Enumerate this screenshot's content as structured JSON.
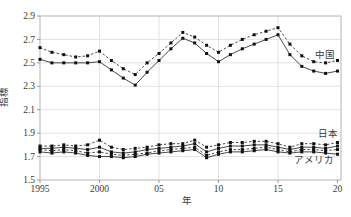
{
  "chart_data": {
    "type": "line",
    "title": "",
    "xlabel": "年",
    "ylabel": "指標",
    "xlim": [
      1995,
      2020
    ],
    "ylim": [
      1.5,
      2.9
    ],
    "grid": true,
    "legend_position": "inline-right-annotations",
    "x": [
      1995,
      1996,
      1997,
      1998,
      1999,
      2000,
      2001,
      2002,
      2003,
      2004,
      2005,
      2006,
      2007,
      2008,
      2009,
      2010,
      2011,
      2012,
      2013,
      2014,
      2015,
      2016,
      2017,
      2018,
      2019,
      2020
    ],
    "xticks": [
      {
        "label": "1995",
        "year": 1995
      },
      {
        "label": "2000",
        "year": 2000
      },
      {
        "label": "05",
        "year": 2005
      },
      {
        "label": "10",
        "year": 2010
      },
      {
        "label": "15",
        "year": 2015
      },
      {
        "label": "20",
        "year": 2020
      }
    ],
    "yticks": [
      {
        "label": "2.9",
        "value": 2.9
      },
      {
        "label": "2.7",
        "value": 2.7
      },
      {
        "label": "2.5",
        "value": 2.5
      },
      {
        "label": "2.3",
        "value": 2.3
      },
      {
        "label": "2.1",
        "value": 2.1
      },
      {
        "label": "1.9",
        "value": 1.9
      },
      {
        "label": "1.7",
        "value": 1.7
      },
      {
        "label": "1.5",
        "value": 1.5
      }
    ],
    "series": [
      {
        "name": "中国 (破線)",
        "country": "中国",
        "style": "dashed",
        "values": [
          2.63,
          2.59,
          2.57,
          2.55,
          2.56,
          2.6,
          2.52,
          2.45,
          2.4,
          2.5,
          2.58,
          2.67,
          2.76,
          2.72,
          2.65,
          2.59,
          2.65,
          2.7,
          2.74,
          2.77,
          2.8,
          2.66,
          2.56,
          2.51,
          2.5,
          2.52
        ]
      },
      {
        "name": "中国 (実線)",
        "country": "中国",
        "style": "solid",
        "values": [
          2.53,
          2.5,
          2.5,
          2.5,
          2.5,
          2.51,
          2.44,
          2.37,
          2.31,
          2.42,
          2.52,
          2.62,
          2.71,
          2.67,
          2.58,
          2.51,
          2.57,
          2.62,
          2.66,
          2.7,
          2.74,
          2.57,
          2.47,
          2.43,
          2.41,
          2.43
        ]
      },
      {
        "name": "日本 (破線)",
        "country": "日本",
        "style": "dashed",
        "values": [
          1.79,
          1.79,
          1.8,
          1.79,
          1.8,
          1.84,
          1.78,
          1.76,
          1.77,
          1.78,
          1.8,
          1.81,
          1.81,
          1.84,
          1.78,
          1.8,
          1.82,
          1.82,
          1.83,
          1.83,
          1.81,
          1.78,
          1.81,
          1.81,
          1.8,
          1.82
        ]
      },
      {
        "name": "日本 (実線)",
        "country": "日本",
        "style": "solid",
        "values": [
          1.77,
          1.77,
          1.78,
          1.77,
          1.76,
          1.78,
          1.74,
          1.73,
          1.74,
          1.76,
          1.77,
          1.78,
          1.79,
          1.81,
          1.74,
          1.77,
          1.79,
          1.79,
          1.8,
          1.8,
          1.78,
          1.76,
          1.78,
          1.78,
          1.77,
          1.79
        ]
      },
      {
        "name": "アメリカ (破線)",
        "country": "アメリカ",
        "style": "dashed",
        "values": [
          1.76,
          1.75,
          1.76,
          1.75,
          1.73,
          1.74,
          1.72,
          1.71,
          1.72,
          1.73,
          1.75,
          1.76,
          1.77,
          1.78,
          1.71,
          1.74,
          1.76,
          1.76,
          1.77,
          1.78,
          1.76,
          1.74,
          1.76,
          1.76,
          1.75,
          1.76
        ]
      },
      {
        "name": "アメリカ (実線)",
        "country": "アメリカ",
        "style": "solid",
        "values": [
          1.74,
          1.73,
          1.74,
          1.73,
          1.71,
          1.7,
          1.7,
          1.69,
          1.7,
          1.72,
          1.73,
          1.74,
          1.75,
          1.76,
          1.69,
          1.72,
          1.74,
          1.74,
          1.75,
          1.76,
          1.74,
          1.73,
          1.74,
          1.74,
          1.73,
          1.72
        ]
      }
    ],
    "annotations": [
      {
        "text": "中国",
        "x": 335,
        "y": 58,
        "anchor": "end"
      },
      {
        "text": "日本",
        "x": 338,
        "y": 137,
        "anchor": "end"
      },
      {
        "text": "アメリカ",
        "x": 334,
        "y": 163,
        "anchor": "end"
      }
    ],
    "colors": {
      "line": "#1a1a1a",
      "marker": "#111111",
      "grid": "#e2e2e2",
      "frame": "#b3b3b3",
      "tick": "#999999",
      "text": "#3a3a3a",
      "background": "#ffffff"
    }
  }
}
